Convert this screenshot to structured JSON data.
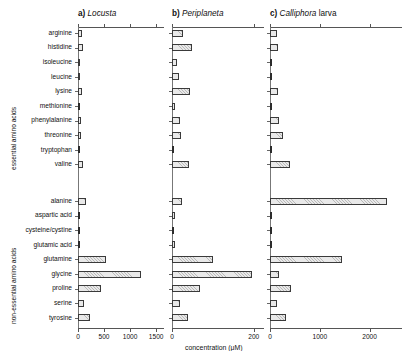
{
  "figure": {
    "xlabel": "concentration (μM)",
    "group_labels": {
      "essential": "essential amino acids",
      "nonessential": "non-essential amino acids"
    }
  },
  "chart_data": {
    "type": "bar",
    "orientation": "horizontal",
    "title": "",
    "xlabel": "concentration (μM)",
    "ylabel": "",
    "grid": false,
    "legend": "none",
    "categories": [
      "arginine",
      "histidine",
      "isoleucine",
      "leucine",
      "lysine",
      "methionine",
      "phenylalanine",
      "threonine",
      "tryptophan",
      "valine",
      "alanine",
      "aspartic acid",
      "cysteine/cystine",
      "glutamic acid",
      "glutamine",
      "glycine",
      "proline",
      "serine",
      "tyrosine"
    ],
    "category_groups": [
      {
        "name": "essential amino acids",
        "members": [
          "arginine",
          "histidine",
          "isoleucine",
          "leucine",
          "lysine",
          "methionine",
          "phenylalanine",
          "threonine",
          "tryptophan",
          "valine"
        ]
      },
      {
        "name": "non-essential amino acids",
        "members": [
          "alanine",
          "aspartic acid",
          "cysteine/cystine",
          "glutamic acid",
          "glutamine",
          "glycine",
          "proline",
          "serine",
          "tyrosine"
        ]
      }
    ],
    "panels": [
      {
        "key": "locusta",
        "index_label": "a)",
        "species": "Locusta",
        "species_suffix": "",
        "xlim": [
          0,
          1650
        ],
        "xticks": [
          0,
          500,
          1000,
          1500
        ],
        "xticklabels": [
          "0",
          "500",
          "1000",
          "1500"
        ],
        "values": [
          80,
          95,
          35,
          35,
          85,
          10,
          55,
          60,
          0,
          90,
          150,
          15,
          0,
          12,
          540,
          1210,
          440,
          110,
          230
        ]
      },
      {
        "key": "periplaneta",
        "index_label": "b)",
        "species": "Periplaneta",
        "species_suffix": "",
        "xlim": [
          0,
          225
        ],
        "xticks": [
          0,
          200
        ],
        "xticklabels": [
          "0",
          "200"
        ],
        "values": [
          28,
          48,
          12,
          18,
          45,
          8,
          20,
          22,
          0,
          42,
          25,
          7,
          0,
          8,
          100,
          196,
          68,
          20,
          38
        ]
      },
      {
        "key": "calliphora",
        "index_label": "c)",
        "species": "Calliphora",
        "species_suffix": "larva",
        "xlim": [
          0,
          2650
        ],
        "xticks": [
          0,
          1000,
          2000
        ],
        "xticklabels": [
          "0",
          "1000",
          "2000"
        ],
        "values": [
          150,
          160,
          20,
          12,
          165,
          10,
          180,
          265,
          0,
          400,
          2350,
          18,
          0,
          20,
          1450,
          190,
          430,
          150,
          330
        ]
      }
    ]
  }
}
